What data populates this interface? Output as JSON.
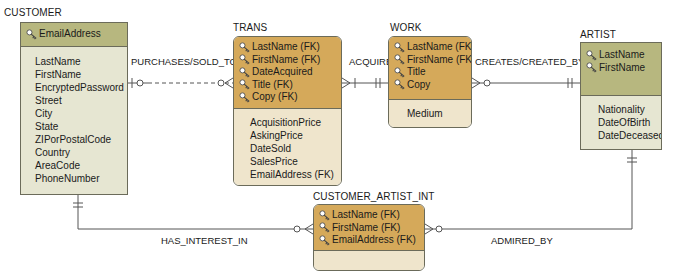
{
  "diagram": {
    "type": "ER diagram (crow's foot)",
    "colors": {
      "strong_header": "#b7b77f",
      "strong_body": "#e6e6d2",
      "weak_header": "#d5a95a",
      "weak_body": "#efe5cc",
      "line": "#555555"
    }
  },
  "entities": {
    "customer": {
      "title": "CUSTOMER",
      "keys": [
        "EmailAddress"
      ],
      "attributes": [
        "LastName",
        "FirstName",
        "EncryptedPassword",
        "Street",
        "City",
        "State",
        "ZIPorPostalCode",
        "Country",
        "AreaCode",
        "PhoneNumber"
      ]
    },
    "trans": {
      "title": "TRANS",
      "keys": [
        "LastName (FK)",
        "FirstName (FK)",
        "DateAcquired",
        "Title (FK)",
        "Copy (FK)"
      ],
      "attributes": [
        "AcquisitionPrice",
        "AskingPrice",
        "DateSold",
        "SalesPrice",
        "EmailAddress (FK)"
      ]
    },
    "work": {
      "title": "WORK",
      "keys": [
        "LastName (FK)",
        "FirstName (FK)",
        "Title",
        "Copy"
      ],
      "attributes": [
        "Medium"
      ]
    },
    "artist": {
      "title": "ARTIST",
      "keys": [
        "LastName",
        "FirstName"
      ],
      "attributes": [
        "Nationality",
        "DateOfBirth",
        "DateDeceased"
      ]
    },
    "customer_artist_int": {
      "title": "CUSTOMER_ARTIST_INT",
      "keys": [
        "LastName (FK)",
        "FirstName (FK)",
        "EmailAddress (FK)"
      ],
      "attributes": []
    }
  },
  "relationships": {
    "purchases": {
      "label": "PURCHASES/SOLD_TO",
      "from": "CUSTOMER",
      "to": "TRANS",
      "style": "dashed"
    },
    "acquired": {
      "label": "ACQUIRED",
      "from": "WORK",
      "to": "TRANS",
      "style": "solid"
    },
    "creates": {
      "label": "CREATES/CREATED_BY",
      "from": "ARTIST",
      "to": "WORK",
      "style": "solid"
    },
    "has_interest": {
      "label": "HAS_INTEREST_IN",
      "from": "CUSTOMER",
      "to": "CUSTOMER_ARTIST_INT",
      "style": "solid"
    },
    "admired_by": {
      "label": "ADMIRED_BY",
      "from": "ARTIST",
      "to": "CUSTOMER_ARTIST_INT",
      "style": "solid"
    }
  }
}
